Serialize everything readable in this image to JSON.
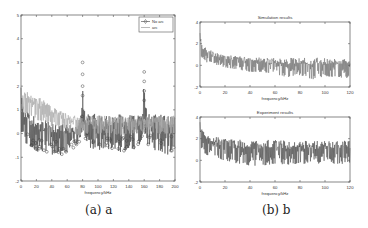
{
  "captions": {
    "a": "(a) a",
    "b": "(b) b"
  },
  "colors": {
    "no_arc": "#444444",
    "arc": "#a8a8a8",
    "sim": "#555555",
    "exp": "#2a2a2a",
    "axis": "#555555"
  },
  "chart_data": [
    {
      "id": "a",
      "type": "line",
      "title": "",
      "xlabel": "frequency/kHz",
      "ylabel": "",
      "xlim": [
        0,
        200
      ],
      "ylim": [
        -2,
        5
      ],
      "xticks": [
        0,
        20,
        40,
        60,
        80,
        100,
        120,
        140,
        160,
        180,
        200
      ],
      "yticks": [
        -2,
        -1,
        0,
        1,
        2,
        3,
        4,
        5
      ],
      "legend": {
        "position": "upper right",
        "entries": [
          "No arc",
          "arc"
        ]
      },
      "series": [
        {
          "name": "No arc",
          "marker": "diamond-circle",
          "x": [
            0,
            2,
            5,
            10,
            15,
            20,
            25,
            30,
            35,
            40,
            45,
            50,
            55,
            60,
            65,
            70,
            75,
            79,
            80,
            81,
            85,
            90,
            100,
            110,
            120,
            130,
            140,
            150,
            158,
            160,
            162,
            170,
            180,
            190,
            200
          ],
          "values": [
            2.3,
            1.2,
            1.0,
            0.9,
            0.8,
            0.7,
            0.6,
            0.6,
            0.5,
            0.5,
            0.4,
            0.4,
            0.4,
            0.4,
            0.4,
            0.4,
            0.5,
            1.2,
            3.0,
            1.2,
            0.8,
            0.9,
            0.8,
            0.8,
            0.8,
            0.8,
            0.8,
            0.8,
            1.1,
            2.6,
            1.1,
            0.8,
            0.8,
            0.8,
            0.8
          ],
          "min_envelope": [
            0.2,
            -0.3,
            -0.4,
            -0.5,
            -0.6,
            -0.8,
            -0.7,
            -0.8,
            -0.9,
            -0.9,
            -0.8,
            -0.9,
            -0.9,
            -0.8,
            -0.7,
            -0.6,
            -0.5,
            0.1,
            0.3,
            0.1,
            -0.4,
            -0.6,
            -0.7,
            -0.7,
            -0.6,
            -0.8,
            -0.6,
            -0.7,
            -0.2,
            0.3,
            -0.3,
            -0.8,
            -0.7,
            -0.9,
            -0.6
          ]
        },
        {
          "name": "arc",
          "marker": "none",
          "x": [
            0,
            2,
            5,
            10,
            15,
            20,
            25,
            30,
            35,
            40,
            45,
            50,
            55,
            60,
            65,
            70,
            75,
            80,
            90,
            100,
            110,
            120,
            130,
            140,
            150,
            160,
            170,
            180,
            190,
            200
          ],
          "values": [
            1.2,
            1.7,
            1.8,
            1.8,
            1.7,
            1.6,
            1.5,
            1.4,
            1.3,
            1.2,
            1.1,
            1.0,
            0.9,
            0.85,
            0.8,
            0.75,
            0.7,
            0.7,
            0.75,
            0.75,
            0.75,
            0.75,
            0.75,
            0.75,
            0.75,
            0.75,
            0.75,
            0.75,
            0.75,
            0.75
          ],
          "min_envelope": [
            0.3,
            0.6,
            0.8,
            0.8,
            0.7,
            0.6,
            0.5,
            0.5,
            0.4,
            0.3,
            0.3,
            0.2,
            0.1,
            0.1,
            0.0,
            0.0,
            -0.1,
            0.0,
            0.0,
            0.0,
            0.0,
            0.0,
            -0.1,
            0.0,
            0.0,
            0.0,
            0.0,
            0.0,
            0.0,
            0.0
          ]
        }
      ]
    },
    {
      "id": "b-top",
      "type": "line",
      "title": "Simulation results",
      "xlabel": "frequency/kHz",
      "ylabel": "",
      "xlim": [
        0,
        120
      ],
      "ylim": [
        -2,
        4
      ],
      "xticks": [
        0,
        20,
        40,
        60,
        80,
        100,
        120
      ],
      "yticks": [
        -2,
        0,
        2,
        4
      ],
      "series": [
        {
          "name": "Simulation",
          "x": [
            0,
            1,
            3,
            5,
            10,
            15,
            20,
            30,
            40,
            50,
            60,
            70,
            80,
            90,
            100,
            110,
            120
          ],
          "values": [
            3.0,
            2.2,
            1.8,
            1.6,
            1.3,
            1.1,
            1.0,
            0.9,
            0.8,
            0.7,
            0.7,
            0.7,
            0.7,
            0.7,
            0.7,
            0.7,
            0.6
          ],
          "min_envelope": [
            1.0,
            0.8,
            0.5,
            0.3,
            0.1,
            0.0,
            -0.2,
            -0.4,
            -0.6,
            -0.6,
            -0.8,
            -1.1,
            -0.9,
            -1.3,
            -1.0,
            -1.1,
            -1.2
          ]
        }
      ]
    },
    {
      "id": "b-bottom",
      "type": "line",
      "title": "Experiment results",
      "xlabel": "frequency/kHz",
      "ylabel": "",
      "xlim": [
        0,
        120
      ],
      "ylim": [
        -2,
        4
      ],
      "xticks": [
        0,
        20,
        40,
        60,
        80,
        100,
        120
      ],
      "yticks": [
        -2,
        0,
        2,
        4
      ],
      "series": [
        {
          "name": "Experiment",
          "x": [
            0,
            1,
            3,
            5,
            10,
            15,
            20,
            30,
            40,
            50,
            60,
            70,
            80,
            90,
            100,
            110,
            120
          ],
          "values": [
            3.6,
            3.0,
            2.7,
            2.5,
            2.3,
            2.1,
            2.0,
            1.9,
            1.9,
            1.9,
            1.9,
            1.8,
            1.8,
            1.8,
            1.8,
            1.8,
            1.8
          ],
          "min_envelope": [
            1.2,
            1.0,
            0.7,
            0.5,
            0.3,
            0.1,
            0.0,
            -0.3,
            -0.5,
            -0.5,
            -0.3,
            -0.4,
            -0.3,
            -0.4,
            -0.2,
            -0.4,
            -0.2
          ]
        }
      ]
    }
  ]
}
